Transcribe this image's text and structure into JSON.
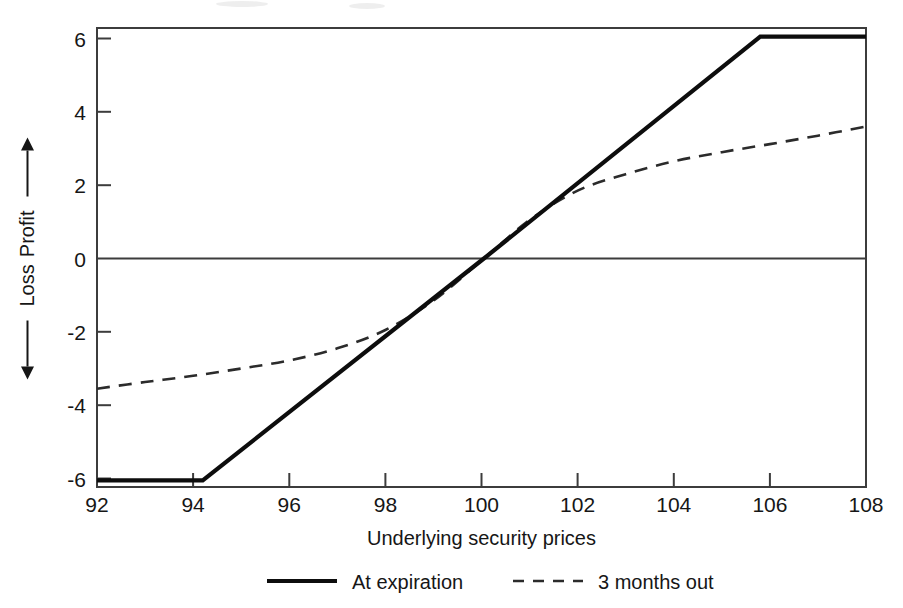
{
  "chart_data": {
    "type": "line",
    "title": "",
    "xlabel": "Underlying security prices",
    "ylabel_positive": "Profit",
    "ylabel_negative": "Loss",
    "xlim": [
      92,
      108
    ],
    "ylim": [
      -6,
      6
    ],
    "xticks": [
      92,
      94,
      96,
      98,
      100,
      102,
      104,
      106,
      108
    ],
    "yticks": [
      6,
      4,
      2,
      0,
      -2,
      -4,
      -6
    ],
    "xtick_labels": [
      "92",
      "94",
      "96",
      "98",
      "100",
      "102",
      "104",
      "106",
      "108"
    ],
    "ytick_labels": [
      "6",
      "4",
      "2",
      "0",
      "-2",
      "-4",
      "-6"
    ],
    "grid": false,
    "legend_position": "below",
    "series": [
      {
        "name": "At expiration",
        "style": "solid",
        "color": "#0d0d0d",
        "x": [
          92,
          94.2,
          100.05,
          105.8,
          108
        ],
        "values": [
          -6.05,
          -6.05,
          0,
          6.05,
          6.05
        ]
      },
      {
        "name": "3 months out",
        "style": "dashed",
        "color": "#2b2b2b",
        "x": [
          92,
          93,
          94,
          95,
          96,
          97,
          98,
          99,
          100.05,
          101,
          102,
          103,
          104,
          105,
          106,
          107,
          108
        ],
        "values": [
          -3.55,
          -3.37,
          -3.2,
          -3.0,
          -2.78,
          -2.45,
          -1.95,
          -1.15,
          0,
          1.05,
          1.85,
          2.3,
          2.65,
          2.9,
          3.12,
          3.35,
          3.6
        ]
      }
    ]
  },
  "axis": {
    "y_arrow_up_label": "Profit",
    "y_arrow_down_label": "Loss",
    "x_title": "Underlying security prices"
  },
  "legend": {
    "items": [
      {
        "label": "At expiration",
        "style": "solid"
      },
      {
        "label": "3 months out",
        "style": "dashed"
      }
    ]
  }
}
